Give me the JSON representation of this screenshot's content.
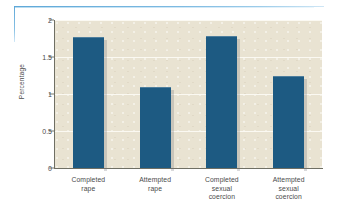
{
  "chart_data": {
    "type": "bar",
    "title": "",
    "xlabel": "",
    "ylabel": "Percentage",
    "categories": [
      "Completed\nrape",
      "Attempted\nrape",
      "Completed\nsexual\ncoercion",
      "Attempted\nsexual\ncoercion"
    ],
    "category_lines": [
      [
        "Completed",
        "rape"
      ],
      [
        "Attempted",
        "rape"
      ],
      [
        "Completed",
        "sexual",
        "coercion"
      ],
      [
        "Attempted",
        "sexual",
        "coercion"
      ]
    ],
    "values": [
      1.77,
      1.1,
      1.78,
      1.25
    ],
    "ylim": [
      0,
      2
    ],
    "ytick_labels": [
      "2",
      "1.5",
      "1",
      "0.5",
      "0"
    ],
    "ytick_values": [
      2,
      1.5,
      1,
      0.5,
      0
    ],
    "grid": "horizontal",
    "legend": "none",
    "colors": {
      "bar": "#1d5a82",
      "plot_background": "#e9e3d2",
      "gridline": "#fbf9f2",
      "axis": "#6f6f64",
      "rule": "#5fa8d8",
      "text": "#4a4a4a",
      "page_background": "#ffffff"
    }
  }
}
